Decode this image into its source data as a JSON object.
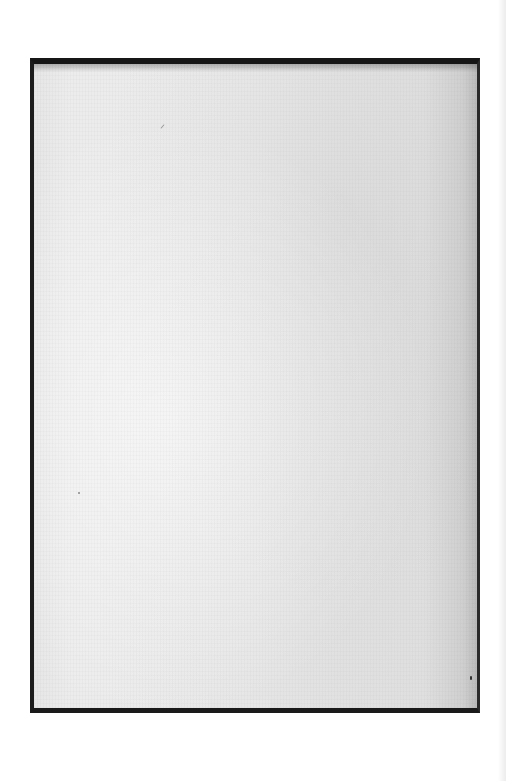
{
  "page": {
    "type": "blank scanned page",
    "text": "",
    "colors": {
      "background": "#ffffff",
      "paper": "#e9e9e9",
      "frame_border": "#161616"
    }
  }
}
